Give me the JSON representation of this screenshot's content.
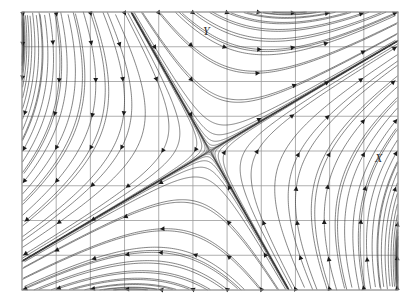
{
  "figure": {
    "kind": "phase-portrait",
    "title": "",
    "background_color": "#ffffff",
    "frame": {
      "x": 22,
      "y": 12,
      "width": 376,
      "height": 278,
      "border_color": "#8a8a8a",
      "border_width": 1.2
    },
    "grid": {
      "visible": true,
      "color": "#9a9a9a",
      "width": 0.8,
      "columns": 11,
      "rows": 8
    }
  },
  "labels": {
    "y_axis": "Y",
    "x_axis": "X"
  },
  "streamlines": {
    "color": "#3a3a3a",
    "width": 0.62,
    "arrow_color": "#1a1a1a",
    "arrow_size": 4.6,
    "count": 120
  },
  "chart_data": {
    "type": "line",
    "subtype": "streamplot",
    "title": "",
    "xlabel": "X",
    "ylabel": "Y",
    "grid": true,
    "legend": false,
    "xlim": [
      -5.5,
      5.5
    ],
    "ylim": [
      -4.0,
      4.0
    ],
    "system": {
      "description": "Linear saddle: dx/dt = a11*x + a12*y, dy/dt = a21*x + a22*y",
      "a11": 0.55,
      "a12": 0.95,
      "a21": 0.95,
      "a22": -0.55
    },
    "fixed_points": [
      {
        "type": "saddle",
        "x": 0.0,
        "y": 0.0,
        "pixel_x": 212,
        "pixel_y": 152
      }
    ],
    "separatrices": [
      {
        "name": "unstable-manifold",
        "slope": 0.515,
        "direction": "outgoing"
      },
      {
        "name": "stable-manifold",
        "slope": -1.94,
        "direction": "incoming"
      }
    ],
    "seeds_left_edge": 26,
    "seeds_right_edge": 26,
    "seeds_top_edge": 22,
    "seeds_bottom_edge": 22,
    "flow_direction_note": "arrows flow outward along shallow positive-slope manifold, inward along steep negative-slope manifold"
  }
}
